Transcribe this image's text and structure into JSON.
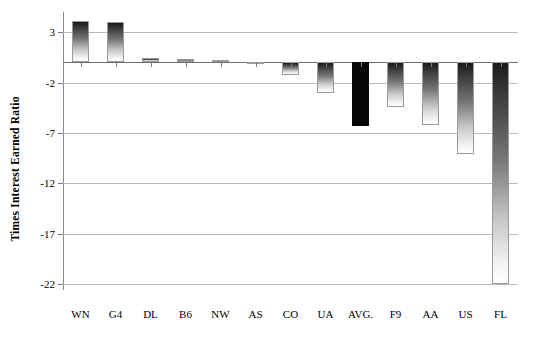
{
  "chart_data": {
    "type": "bar",
    "title": "",
    "xlabel": "",
    "ylabel": "Times Interest Earned Ratio",
    "categories": [
      "WN",
      "G4",
      "DL",
      "B6",
      "NW",
      "AS",
      "CO",
      "UA",
      "AVG.",
      "F9",
      "AA",
      "US",
      "FL"
    ],
    "values": [
      4.1,
      4.0,
      0.4,
      0.3,
      0.2,
      -0.2,
      -1.3,
      -3.0,
      -6.3,
      -4.4,
      -6.2,
      -9.1,
      -22.0
    ],
    "series": [
      {
        "name": "Times Interest Earned Ratio",
        "values": [
          4.1,
          4.0,
          0.4,
          0.3,
          0.2,
          -0.2,
          -1.3,
          -3.0,
          -6.3,
          -4.4,
          -6.2,
          -9.1,
          -22.0
        ]
      }
    ],
    "ylim": [
      -22.6,
      5.0
    ],
    "yticks": [
      3,
      -2,
      -7,
      -12,
      -17,
      -22
    ],
    "ytick_labels": [
      "3",
      "-2",
      "-7",
      "-12",
      "-17",
      "-22"
    ],
    "grid": true,
    "gridline_axis": "y",
    "legend": null,
    "legend_position": "none",
    "highlight_category": "AVG.",
    "bar_fill": "vertical grayscale gradient, dark top to light bottom",
    "highlight_fill": "solid black",
    "colors": {
      "bar_dark": "#1a1a1a",
      "bar_light": "#ffffff",
      "bar_border": "#9a9a9a",
      "highlight": "#080808",
      "gridline": "#b9b9b9",
      "axis": "#7a7a7a",
      "text": "#000000",
      "background": "#ffffff"
    }
  }
}
